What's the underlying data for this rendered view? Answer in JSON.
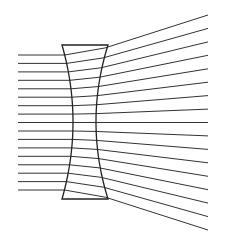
{
  "diagram": {
    "colors": {
      "background": "#ffffff",
      "ray": "#333333",
      "lens": "#222222"
    },
    "lens": {
      "type": "biconcave",
      "top_y": 45,
      "bottom_y": 199,
      "left_edge_x": 62,
      "right_edge_x": 108,
      "left_center_x": 73,
      "right_center_x": 96
    },
    "rays": {
      "count": 17,
      "start_x": 18,
      "end_x": 208,
      "incoming_y": [
        55,
        63.4,
        71.9,
        80.3,
        88.8,
        97.2,
        105.7,
        114.1,
        122.5,
        131,
        139.4,
        147.9,
        156.3,
        164.8,
        173.2,
        181.6,
        190
      ],
      "outgoing_end_y": [
        15,
        28.4,
        41.9,
        55.3,
        68.8,
        82.2,
        95.6,
        109.1,
        122.5,
        135.9,
        149.4,
        162.8,
        176.3,
        189.7,
        203.1,
        216.6,
        230
      ]
    }
  }
}
